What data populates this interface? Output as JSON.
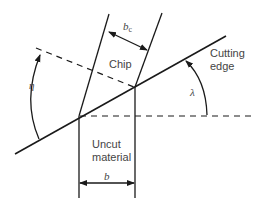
{
  "diagram": {
    "labels": {
      "chip": "Chip",
      "cutting_edge_line1": "Cutting",
      "cutting_edge_line2": "edge",
      "uncut_line1": "Uncut",
      "uncut_line2": "material",
      "chip_width": "b",
      "chip_width_sub": "c",
      "uncut_width": "b",
      "chip_flow_angle": "η",
      "inclination_angle": "λ"
    },
    "colors": {
      "line": "#1a1a1a",
      "text": "#444444",
      "background": "#ffffff"
    }
  }
}
